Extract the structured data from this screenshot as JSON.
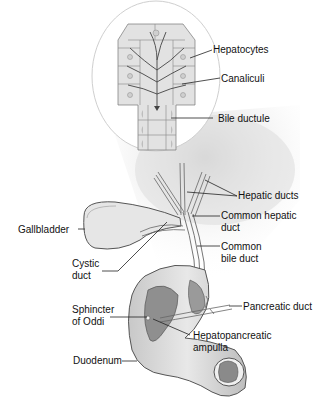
{
  "diagram": {
    "labels": {
      "hepatocytes": "Hepatocytes",
      "canaliculi": "Canaliculi",
      "bile_ductule": "Bile ductule",
      "hepatic_ducts": "Hepatic ducts",
      "common_hepatic_duct_1": "Common hepatic",
      "common_hepatic_duct_2": "duct",
      "gallbladder": "Gallbladder",
      "common_bile_duct_1": "Common",
      "common_bile_duct_2": "bile duct",
      "cystic_duct_1": "Cystic",
      "cystic_duct_2": "duct",
      "pancreatic_duct": "Pancreatic duct",
      "sphincter_1": "Sphincter",
      "sphincter_2": "of Oddi",
      "ampulla_1": "Hepatopancreatic",
      "ampulla_2": "ampulla",
      "duodenum": "Duodenum"
    },
    "colors": {
      "tissue_fill": "#e4e4e4",
      "shadow": "#d8d8d8",
      "outline": "#555555",
      "duodenum_inner": "#8a8a8a",
      "leader": "#222222"
    }
  }
}
